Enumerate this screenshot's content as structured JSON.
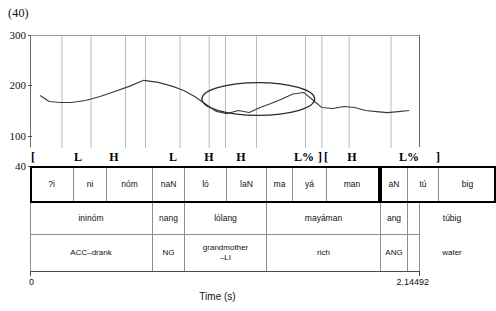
{
  "figure": {
    "example_number": "(40)"
  },
  "chart_data": {
    "type": "line",
    "title": "(40)",
    "xlabel": "Time (s)",
    "ylabel": "",
    "xlim": [
      0,
      2.14492
    ],
    "ylim": [
      40,
      300
    ],
    "yticks": [
      300,
      200,
      100,
      40
    ],
    "xticklabels": [
      "0",
      "2.14492"
    ],
    "grid": true,
    "legend": "none",
    "series": [
      {
        "name": "F0 pitch track",
        "x": [
          0.05,
          0.1,
          0.16,
          0.22,
          0.3,
          0.38,
          0.46,
          0.54,
          0.62,
          0.7,
          0.78,
          0.84,
          0.9,
          0.96,
          1.02,
          1.08,
          1.14,
          1.2,
          1.26,
          1.32,
          1.38,
          1.44,
          1.5,
          1.56,
          1.6,
          1.66,
          1.72,
          1.78,
          1.84,
          1.9,
          1.96,
          2.02,
          2.08
        ],
        "y": [
          182,
          170,
          168,
          168,
          172,
          180,
          190,
          200,
          212,
          208,
          200,
          192,
          180,
          165,
          150,
          146,
          152,
          148,
          158,
          166,
          175,
          185,
          188,
          170,
          158,
          156,
          160,
          158,
          152,
          150,
          148,
          150,
          152
        ]
      }
    ],
    "annotations": [
      {
        "type": "ellipse",
        "label": "highlight-ellipse",
        "center_x": 1.25,
        "center_y": 175,
        "width_x": 0.62,
        "height_y": 65
      }
    ],
    "gridline_x": [
      0.17,
      0.33,
      0.52,
      0.63,
      0.82,
      0.98,
      1.07,
      1.24,
      1.51,
      1.6,
      1.75,
      1.98
    ]
  },
  "tone_tier": {
    "name": "tone-tier",
    "items": [
      {
        "label": "[",
        "align": "left",
        "x": 0,
        "w": 30
      },
      {
        "label": "L",
        "align": "center",
        "x": 30,
        "w": 36
      },
      {
        "label": "H",
        "align": "center",
        "x": 66,
        "w": 36
      },
      {
        "label": "L",
        "align": "center",
        "x": 123,
        "w": 40
      },
      {
        "label": "H",
        "align": "center",
        "x": 163,
        "w": 32
      },
      {
        "label": "H",
        "align": "center",
        "x": 195,
        "w": 32
      },
      {
        "label": "L%",
        "align": "right",
        "x": 227,
        "w": 57
      },
      {
        "label": "]",
        "align": "right",
        "x": 284,
        "w": 8
      },
      {
        "label": "[",
        "align": "left",
        "x": 293,
        "w": 10
      },
      {
        "label": "H",
        "align": "center",
        "x": 303,
        "w": 38
      },
      {
        "label": "L%",
        "align": "right",
        "x": 341,
        "w": 48
      },
      {
        "label": "]",
        "align": "right",
        "x": 398,
        "w": 12
      }
    ]
  },
  "tiers": {
    "syllable_row": {
      "name": "syllable-tier",
      "cells": [
        {
          "text": "?i",
          "x": 0,
          "w": 43
        },
        {
          "text": "ni",
          "x": 43,
          "w": 33
        },
        {
          "text": "nóm",
          "x": 76,
          "w": 46
        },
        {
          "text": "naN",
          "x": 122,
          "w": 32
        },
        {
          "text": "ló",
          "x": 154,
          "w": 42
        },
        {
          "text": "laN",
          "x": 196,
          "w": 40
        },
        {
          "text": "ma",
          "x": 236,
          "w": 26
        },
        {
          "text": "yá",
          "x": 262,
          "w": 34
        },
        {
          "text": "man",
          "x": 296,
          "w": 51
        },
        {
          "text": "aN",
          "x": 350,
          "w": 27
        },
        {
          "text": "tú",
          "x": 377,
          "w": 31
        },
        {
          "text": "big",
          "x": 408,
          "w": 58
        }
      ]
    },
    "word_row": {
      "name": "word-tier",
      "cells": [
        {
          "text": "ininóm",
          "x": 0,
          "w": 122
        },
        {
          "text": "nang",
          "x": 122,
          "w": 32
        },
        {
          "text": "lólang",
          "x": 154,
          "w": 82
        },
        {
          "text": "mayáman",
          "x": 236,
          "w": 114
        },
        {
          "text": "ang",
          "x": 350,
          "w": 27
        },
        {
          "text": "túbig",
          "x": 377,
          "w": 89
        }
      ]
    },
    "gloss_row": {
      "name": "gloss-tier",
      "cells": [
        {
          "text": "ACC–drank",
          "x": 0,
          "w": 122
        },
        {
          "text": "NG",
          "x": 122,
          "w": 32
        },
        {
          "text": "grandmother\n–LI",
          "x": 154,
          "w": 82
        },
        {
          "text": "rich",
          "x": 236,
          "w": 114
        },
        {
          "text": "ANG",
          "x": 350,
          "w": 27
        },
        {
          "text": "water",
          "x": 377,
          "w": 89
        }
      ]
    }
  },
  "axis": {
    "time_start": "0",
    "time_end": "2.14492",
    "time_title": "Time (s)"
  },
  "colors": {
    "track": "#3a3a3a",
    "grid": "#b9b9b9",
    "frame": "#6a6a6a",
    "text": "#111111",
    "heavy_border": "#000000"
  }
}
